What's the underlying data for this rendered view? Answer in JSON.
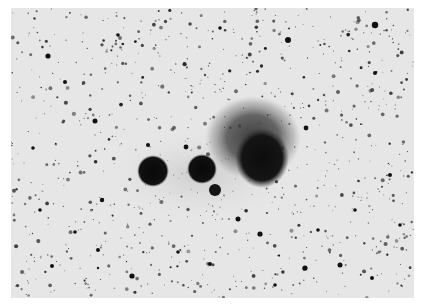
{
  "image": {
    "kind": "negative astronomical photograph",
    "subject": "star field with emission nebula and compact nebulous knots",
    "frame": {
      "x": 11,
      "y": 8,
      "width": 403,
      "height": 290
    },
    "colors": {
      "border": "#ffffff",
      "sky": "#e6e6e6",
      "star": "#111111",
      "nebula": "#1a1a1a"
    }
  },
  "objects": {
    "nebula_halo": {
      "cx": 253,
      "cy": 138,
      "rx": 48,
      "ry": 42
    },
    "nebula_core": {
      "cx": 262,
      "cy": 158,
      "rx": 27,
      "ry": 30
    },
    "knot_left": {
      "cx": 153,
      "cy": 171,
      "r": 16
    },
    "knot_middle": {
      "cx": 202,
      "cy": 169,
      "r": 15
    },
    "knot_small": {
      "cx": 215,
      "cy": 190,
      "r": 6
    }
  },
  "bright_stars": [
    [
      375,
      25,
      3.2
    ],
    [
      288,
      40,
      3
    ],
    [
      48,
      56,
      2.6
    ],
    [
      95,
      121,
      2.5
    ],
    [
      306,
      128,
      2.4
    ],
    [
      148,
      145,
      2
    ],
    [
      186,
      147,
      2.4
    ],
    [
      52,
      266,
      2
    ],
    [
      238,
      219,
      2.5
    ],
    [
      260,
      234,
      2.6
    ],
    [
      305,
      268,
      2.6
    ],
    [
      340,
      265,
      2.5
    ],
    [
      210,
      264,
      2
    ],
    [
      372,
      278,
      2
    ],
    [
      132,
      276,
      2.6
    ],
    [
      98,
      250,
      2
    ],
    [
      102,
      200,
      2.2
    ],
    [
      390,
      175,
      2
    ],
    [
      375,
      73,
      2
    ],
    [
      65,
      82,
      2
    ],
    [
      220,
      28,
      1.8
    ],
    [
      33,
      148,
      1.8
    ],
    [
      400,
      225,
      1.8
    ],
    [
      275,
      285,
      1.8
    ],
    [
      178,
      252,
      1.8
    ],
    [
      318,
      230,
      1.8
    ],
    [
      355,
      210,
      1.8
    ],
    [
      40,
      210,
      1.8
    ],
    [
      75,
      232,
      1.8
    ],
    [
      118,
      35,
      1.8
    ]
  ]
}
